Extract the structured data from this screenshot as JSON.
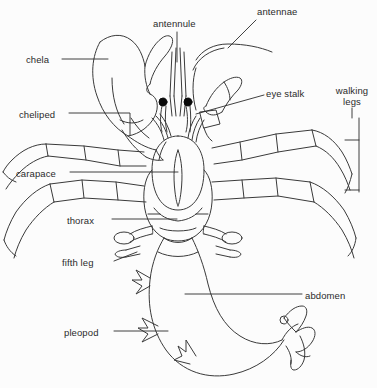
{
  "figure": {
    "background_color": "#fcfcfc",
    "line_color": "#3a3a3a",
    "text_color": "#2b2b2b",
    "eye_color": "#000000"
  },
  "labels": [
    {
      "id": "chela",
      "text": "chela",
      "x": 26,
      "y": 54,
      "align": "left"
    },
    {
      "id": "antennule",
      "text": "antennule",
      "x": 153,
      "y": 18,
      "align": "left"
    },
    {
      "id": "antennae",
      "text": "antennae",
      "x": 257,
      "y": 6,
      "align": "left"
    },
    {
      "id": "eye-stalk",
      "text": "eye stalk",
      "x": 266,
      "y": 88,
      "align": "left"
    },
    {
      "id": "walking-legs",
      "text": "walking legs",
      "x": 331,
      "y": 85,
      "align": "center"
    },
    {
      "id": "cheliped",
      "text": "cheliped",
      "x": 19,
      "y": 109,
      "align": "left"
    },
    {
      "id": "carapace",
      "text": "carapace",
      "x": 16,
      "y": 168,
      "align": "left"
    },
    {
      "id": "thorax",
      "text": "thorax",
      "x": 67,
      "y": 215,
      "align": "left"
    },
    {
      "id": "fifth-leg",
      "text": "fifth leg",
      "x": 62,
      "y": 257,
      "align": "left"
    },
    {
      "id": "abdomen",
      "text": "abdomen",
      "x": 305,
      "y": 290,
      "align": "left"
    },
    {
      "id": "pleopod",
      "text": "pleopod",
      "x": 64,
      "y": 327,
      "align": "left"
    }
  ],
  "leader_lines": [
    {
      "for": "chela",
      "points": "62,59 108,59"
    },
    {
      "for": "antennule",
      "points": "177,32 177,62"
    },
    {
      "for": "antennae",
      "points": "256,20 228,48"
    },
    {
      "for": "eye-stalk",
      "points": "264,95 196,114"
    },
    {
      "for": "cheliped",
      "points": "69,113 130,113 130,135"
    },
    {
      "for": "carapace",
      "points": "70,172 178,172"
    },
    {
      "for": "thorax",
      "points": "112,219 177,219"
    },
    {
      "for": "fifth-leg",
      "points": "114,261 137,252"
    },
    {
      "for": "abdomen",
      "points": "302,294 185,294"
    },
    {
      "for": "pleopod",
      "points": "114,331 168,331"
    }
  ],
  "bracket": {
    "for": "walking-legs",
    "x": 359,
    "y_top": 118,
    "y_bottom": 192,
    "tick_length": 14,
    "ticks_y": [
      140,
      190
    ]
  },
  "anatomy_parts": [
    "chela",
    "antennule",
    "antennae",
    "eye stalk",
    "walking legs",
    "cheliped",
    "carapace",
    "thorax",
    "fifth leg",
    "abdomen",
    "pleopod"
  ]
}
